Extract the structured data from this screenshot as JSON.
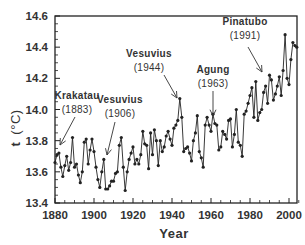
{
  "chart_data": {
    "type": "line",
    "title": "",
    "xlabel": "Year",
    "ylabel": "t (°C)",
    "xlim": [
      1880,
      2005
    ],
    "ylim": [
      13.4,
      14.6
    ],
    "x_ticks": [
      1880,
      1900,
      1920,
      1940,
      1960,
      1980,
      2000
    ],
    "x_tick_labels": [
      "1880",
      "1900",
      "1920",
      "1940",
      "1960",
      "1980",
      "2000"
    ],
    "y_ticks": [
      13.4,
      13.6,
      13.8,
      14.0,
      14.2,
      14.4,
      14.6
    ],
    "y_tick_labels": [
      "13.4",
      "13.6",
      "13.8",
      "14.0",
      "14.2",
      "14.4",
      "14.6"
    ],
    "grid": false,
    "legend": null,
    "series": [
      {
        "name": "Global mean temperature",
        "marker": "circle",
        "color": "#222222",
        "x": [
          1880,
          1881,
          1882,
          1883,
          1884,
          1885,
          1886,
          1887,
          1888,
          1889,
          1890,
          1891,
          1892,
          1893,
          1894,
          1895,
          1896,
          1897,
          1898,
          1899,
          1900,
          1901,
          1902,
          1903,
          1904,
          1905,
          1906,
          1907,
          1908,
          1909,
          1910,
          1911,
          1912,
          1913,
          1914,
          1915,
          1916,
          1917,
          1918,
          1919,
          1920,
          1921,
          1922,
          1923,
          1924,
          1925,
          1926,
          1927,
          1928,
          1929,
          1930,
          1931,
          1932,
          1933,
          1934,
          1935,
          1936,
          1937,
          1938,
          1939,
          1940,
          1941,
          1942,
          1943,
          1944,
          1945,
          1946,
          1947,
          1948,
          1949,
          1950,
          1951,
          1952,
          1953,
          1954,
          1955,
          1956,
          1957,
          1958,
          1959,
          1960,
          1961,
          1962,
          1963,
          1964,
          1965,
          1966,
          1967,
          1968,
          1969,
          1970,
          1971,
          1972,
          1973,
          1974,
          1975,
          1976,
          1977,
          1978,
          1979,
          1980,
          1981,
          1982,
          1983,
          1984,
          1985,
          1986,
          1987,
          1988,
          1989,
          1990,
          1991,
          1992,
          1993,
          1994,
          1995,
          1996,
          1997,
          1998,
          1999,
          2000,
          2001,
          2002,
          2003,
          2004
        ],
        "values": [
          13.66,
          13.71,
          13.72,
          13.63,
          13.57,
          13.64,
          13.7,
          13.61,
          13.66,
          13.82,
          13.63,
          13.65,
          13.58,
          13.53,
          13.6,
          13.79,
          13.81,
          13.65,
          13.74,
          13.81,
          13.73,
          13.63,
          13.55,
          13.5,
          13.6,
          13.68,
          13.49,
          13.49,
          13.51,
          13.54,
          13.54,
          13.59,
          13.6,
          13.77,
          13.82,
          13.63,
          13.48,
          13.6,
          13.68,
          13.72,
          13.76,
          13.65,
          13.68,
          13.65,
          13.71,
          13.86,
          13.78,
          13.77,
          13.62,
          13.85,
          13.71,
          13.87,
          13.8,
          13.64,
          13.8,
          13.73,
          13.76,
          13.83,
          13.86,
          13.81,
          13.77,
          13.88,
          13.9,
          13.93,
          14.07,
          13.95,
          13.73,
          13.75,
          13.76,
          13.72,
          13.67,
          13.8,
          13.85,
          13.96,
          13.73,
          13.69,
          13.63,
          13.9,
          13.95,
          13.9,
          13.86,
          13.97,
          13.91,
          13.9,
          13.74,
          13.76,
          13.86,
          13.84,
          13.81,
          13.93,
          13.94,
          13.76,
          13.84,
          14.0,
          13.79,
          13.77,
          13.7,
          13.97,
          13.99,
          14.04,
          14.09,
          14.14,
          13.95,
          14.18,
          13.93,
          13.98,
          14.0,
          14.11,
          14.15,
          14.04,
          14.22,
          14.19,
          14.06,
          14.1,
          14.15,
          14.21,
          14.09,
          14.25,
          14.48,
          14.2,
          14.16,
          14.32,
          14.43,
          14.41,
          14.4
        ]
      }
    ],
    "annotations": [
      {
        "label": "Krakatau",
        "year_label": "(1883)",
        "year": 1883
      },
      {
        "label": "Vesuvius",
        "year_label": "(1906)",
        "year": 1906
      },
      {
        "label": "Vesuvius",
        "year_label": "(1944)",
        "year": 1944
      },
      {
        "label": "Agung",
        "year_label": "(1963)",
        "year": 1963
      },
      {
        "label": "Pinatubo",
        "year_label": "(1991)",
        "year": 1991
      }
    ]
  },
  "axes": {
    "xlabel": "Year",
    "ylabel_t": "t",
    "ylabel_unit": "(°C)"
  }
}
